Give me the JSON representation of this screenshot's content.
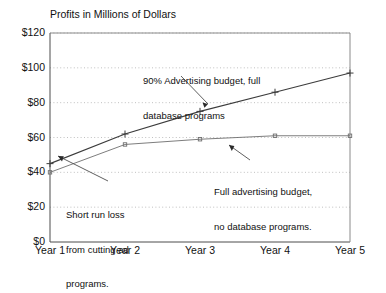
{
  "chart_data": {
    "type": "line",
    "title": "Profits in Millions of Dollars",
    "xlabel": "",
    "ylabel": "",
    "categories": [
      "Year 1",
      "Year 2",
      "Year 3",
      "Year 4",
      "Year 5"
    ],
    "ylim": [
      0,
      120
    ],
    "yticks": [
      "$0",
      "$20",
      "$40",
      "$60",
      "$80",
      "$100",
      "$120"
    ],
    "ytick_values": [
      0,
      20,
      40,
      60,
      80,
      100,
      120
    ],
    "grid": "horizontal-dotted",
    "legend": "none (inline annotations)",
    "series": [
      {
        "name": "90% Advertising budget, full database programs",
        "marker": "plus",
        "values": [
          45,
          62,
          75,
          86,
          97
        ]
      },
      {
        "name": "Full advertising budget, no database programs.",
        "marker": "square",
        "values": [
          40,
          56,
          59,
          61,
          61
        ]
      }
    ],
    "annotations": [
      {
        "id": "annot-top",
        "lines": [
          "90% Advertising budget, full",
          "database programs"
        ],
        "points_to": "Year 3 upper series point"
      },
      {
        "id": "annot-right",
        "lines": [
          "Full advertising budget,",
          "no database programs."
        ],
        "points_to": "lower series between Year 3 and Year 4"
      },
      {
        "id": "annot-left",
        "lines": [
          "Short run loss",
          "from cutting ad",
          "programs."
        ],
        "points_to": "Year 1 lower series point"
      }
    ],
    "colors": {
      "background": "#ffffff",
      "axis": "#4d4d4d",
      "gridline": "#b0b0b0",
      "series1": "#3c3c3c",
      "series2": "#6e6e6e",
      "text": "#111111"
    }
  }
}
